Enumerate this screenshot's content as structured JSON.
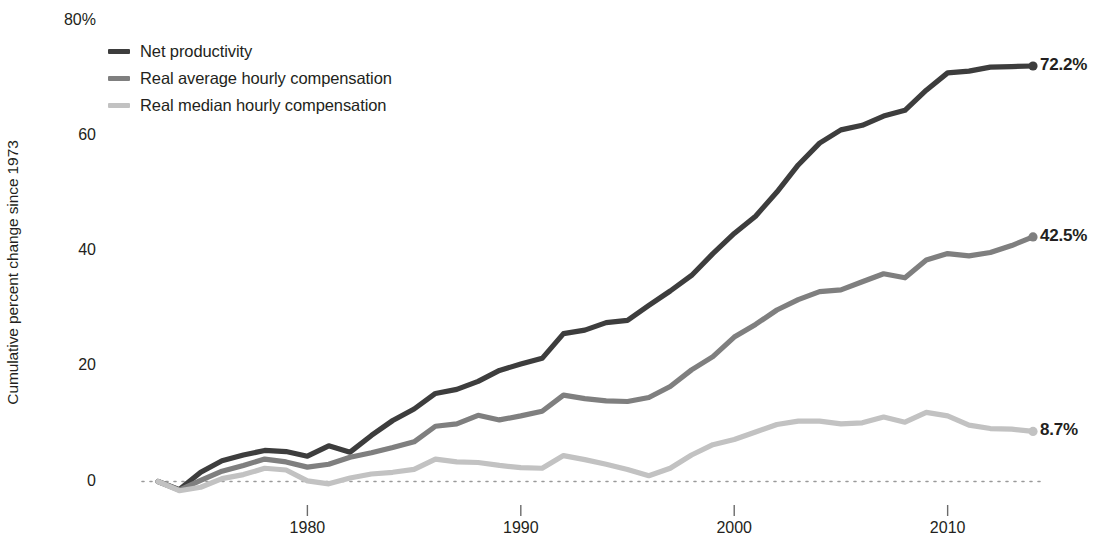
{
  "chart_data": {
    "type": "line",
    "title": "",
    "subtitle": "",
    "xlabel": "",
    "ylabel": "Cumulative percent change since 1973",
    "xlim": [
      1973,
      2014
    ],
    "ylim": [
      -5,
      80
    ],
    "grid": false,
    "zero_line": true,
    "legend_position": "top-left",
    "y_ticks": [
      {
        "value": 80,
        "label": "80%"
      },
      {
        "value": 60,
        "label": "60"
      },
      {
        "value": 40,
        "label": "40"
      },
      {
        "value": 20,
        "label": "20"
      },
      {
        "value": 0,
        "label": "0"
      }
    ],
    "x_ticks": [
      {
        "value": 1980,
        "label": "1980"
      },
      {
        "value": 1990,
        "label": "1990"
      },
      {
        "value": 2000,
        "label": "2000"
      },
      {
        "value": 2010,
        "label": "2010"
      }
    ],
    "x": [
      1973,
      1974,
      1975,
      1976,
      1977,
      1978,
      1979,
      1980,
      1981,
      1982,
      1983,
      1984,
      1985,
      1986,
      1987,
      1988,
      1989,
      1990,
      1991,
      1992,
      1993,
      1994,
      1995,
      1996,
      1997,
      1998,
      1999,
      2000,
      2001,
      2002,
      2003,
      2004,
      2005,
      2006,
      2007,
      2008,
      2009,
      2010,
      2011,
      2012,
      2013,
      2014
    ],
    "series": [
      {
        "name": "Net productivity",
        "color": "#3d3d3d",
        "end_label": "72.2%",
        "end_value": 72.2,
        "values": [
          0,
          -1.4,
          1.6,
          3.6,
          4.6,
          5.4,
          5.2,
          4.4,
          6.2,
          5.1,
          8.0,
          10.6,
          12.6,
          15.3,
          16.0,
          17.4,
          19.3,
          20.4,
          21.4,
          25.7,
          26.3,
          27.6,
          28.0,
          30.6,
          33.1,
          35.8,
          39.6,
          43.1,
          46.1,
          50.3,
          55.0,
          58.8,
          61.1,
          61.9,
          63.5,
          64.5,
          68.0,
          71.0,
          71.3,
          72.0,
          72.1,
          72.2
        ]
      },
      {
        "name": "Real average hourly compensation",
        "color": "#7f7f7f",
        "end_label": "42.5%",
        "end_value": 42.5,
        "values": [
          0,
          -1.5,
          0.2,
          1.8,
          2.8,
          3.9,
          3.4,
          2.5,
          3.0,
          4.2,
          5.0,
          5.9,
          6.9,
          9.6,
          10.0,
          11.5,
          10.7,
          11.4,
          12.2,
          15.0,
          14.4,
          14.0,
          13.9,
          14.6,
          16.5,
          19.4,
          21.7,
          25.1,
          27.3,
          29.8,
          31.6,
          33.0,
          33.3,
          34.7,
          36.1,
          35.4,
          38.5,
          39.6,
          39.2,
          39.8,
          41.0,
          42.5
        ]
      },
      {
        "name": "Real median hourly compensation",
        "color": "#c2c2c2",
        "end_label": "8.7%",
        "end_value": 8.7,
        "values": [
          0,
          -1.6,
          -1.0,
          0.5,
          1.2,
          2.3,
          2.0,
          0.1,
          -0.4,
          0.6,
          1.3,
          1.6,
          2.1,
          3.9,
          3.4,
          3.3,
          2.8,
          2.4,
          2.3,
          4.5,
          3.8,
          3.0,
          2.1,
          1.0,
          2.3,
          4.6,
          6.4,
          7.3,
          8.6,
          9.9,
          10.5,
          10.5,
          10.0,
          10.2,
          11.2,
          10.3,
          12.0,
          11.4,
          9.8,
          9.2,
          9.1,
          8.7
        ]
      }
    ]
  },
  "legend": {
    "items": [
      {
        "label": "Net productivity",
        "color": "#3d3d3d"
      },
      {
        "label": "Real average hourly compensation",
        "color": "#7f7f7f"
      },
      {
        "label": "Real median hourly compensation",
        "color": "#c2c2c2"
      }
    ]
  },
  "axes": {
    "y_title": "Cumulative percent change since 1973"
  }
}
